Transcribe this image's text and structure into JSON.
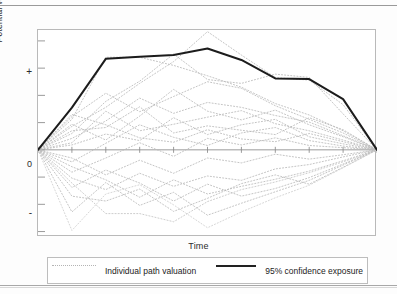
{
  "figure": {
    "axes": {
      "ylabel": "Potential value",
      "xlabel": "Time",
      "ytick_plus": "+",
      "ytick_zero": "0",
      "ytick_minus": "-"
    },
    "legend": {
      "individual_label": "Individual path valuation",
      "confidence_label": "95% confidence exposure",
      "individual_swatch": "dotted-line-swatch",
      "confidence_swatch": "solid-line-swatch"
    }
  },
  "chart_data": {
    "type": "line",
    "title": "",
    "subtitle": "",
    "xlabel": "Time",
    "ylabel": "Potential value",
    "xlim": [
      0,
      20
    ],
    "ylim": [
      -3.2,
      4.4
    ],
    "grid": false,
    "legend_position": "bottom",
    "xticks": [
      0,
      2,
      4,
      6,
      8,
      10,
      12,
      14,
      16,
      18,
      20
    ],
    "xticklabels": [
      "",
      "",
      "",
      "",
      "",
      "",
      "",
      "",
      "",
      "",
      ""
    ],
    "yticks": [
      -3,
      -2,
      -1,
      0,
      1,
      2,
      3,
      4
    ],
    "yticklabels": [
      "",
      "-",
      "",
      "0",
      "",
      "",
      "+",
      ""
    ],
    "x": [
      0,
      2,
      4,
      6,
      8,
      10,
      12,
      14,
      16,
      18,
      20
    ],
    "series": [
      {
        "name": "95% confidence exposure",
        "style": "solid",
        "color": "#1c1c1c",
        "width": 2.0,
        "values": [
          0.0,
          1.55,
          3.34,
          3.42,
          3.48,
          3.72,
          3.3,
          2.62,
          2.6,
          1.86,
          0.0
        ]
      },
      {
        "name": "Individual path valuation 1",
        "style": "dotted",
        "color": "#b9b9b9",
        "values": [
          0.0,
          1.12,
          3.4,
          3.4,
          3.1,
          2.72,
          2.3,
          1.7,
          1.28,
          0.7,
          0.0
        ]
      },
      {
        "name": "Individual path valuation 2",
        "style": "dotted",
        "color": "#b9b9b9",
        "values": [
          0.0,
          0.86,
          1.56,
          2.44,
          3.24,
          4.34,
          3.48,
          2.66,
          2.56,
          1.66,
          0.0
        ]
      },
      {
        "name": "Individual path valuation 3",
        "style": "dotted",
        "color": "#b9b9b9",
        "values": [
          0.0,
          0.6,
          1.78,
          2.52,
          3.52,
          2.58,
          2.44,
          2.78,
          2.66,
          1.32,
          0.0
        ]
      },
      {
        "name": "Individual path valuation 4",
        "style": "dotted",
        "color": "#b9b9b9",
        "values": [
          0.0,
          1.22,
          2.08,
          1.4,
          1.96,
          2.5,
          2.26,
          1.62,
          1.12,
          0.62,
          0.0
        ]
      },
      {
        "name": "Individual path valuation 5",
        "style": "dotted",
        "color": "#b9b9b9",
        "values": [
          0.0,
          0.42,
          1.06,
          1.9,
          1.34,
          1.74,
          1.56,
          1.26,
          1.02,
          0.52,
          0.0
        ]
      },
      {
        "name": "Individual path valuation 6",
        "style": "dotted",
        "color": "#b9b9b9",
        "values": [
          0.0,
          0.94,
          0.36,
          1.24,
          2.22,
          1.42,
          1.1,
          1.46,
          0.92,
          0.48,
          0.0
        ]
      },
      {
        "name": "Individual path valuation 7",
        "style": "dotted",
        "color": "#b9b9b9",
        "values": [
          0.0,
          0.26,
          1.42,
          0.7,
          0.94,
          1.2,
          1.44,
          0.96,
          0.7,
          0.36,
          0.0
        ]
      },
      {
        "name": "Individual path valuation 8",
        "style": "dotted",
        "color": "#b9b9b9",
        "values": [
          0.0,
          0.7,
          0.82,
          1.58,
          0.62,
          0.88,
          0.72,
          0.56,
          1.18,
          0.74,
          0.0
        ]
      },
      {
        "name": "Individual path valuation 9",
        "style": "dotted",
        "color": "#b9b9b9",
        "values": [
          0.0,
          0.18,
          0.58,
          0.34,
          1.18,
          0.56,
          0.92,
          1.12,
          0.48,
          0.22,
          0.0
        ]
      },
      {
        "name": "Individual path valuation 10",
        "style": "dotted",
        "color": "#b9b9b9",
        "values": [
          0.0,
          1.3,
          0.92,
          0.44,
          0.28,
          0.74,
          0.4,
          0.3,
          0.6,
          0.3,
          0.0
        ]
      },
      {
        "name": "Individual path valuation 11",
        "style": "dotted",
        "color": "#b9b9b9",
        "values": [
          0.0,
          -0.44,
          0.24,
          0.92,
          0.46,
          0.16,
          0.62,
          0.82,
          0.34,
          0.14,
          0.0
        ]
      },
      {
        "name": "Individual path valuation 12",
        "style": "dotted",
        "color": "#b9b9b9",
        "values": [
          0.0,
          -0.82,
          -0.3,
          0.26,
          -0.24,
          0.42,
          0.18,
          0.44,
          0.16,
          0.08,
          0.0
        ]
      },
      {
        "name": "Individual path valuation 13",
        "style": "dotted",
        "color": "#b9b9b9",
        "values": [
          0.0,
          -0.3,
          -0.92,
          -0.38,
          -0.86,
          -0.3,
          -0.48,
          -0.16,
          -0.34,
          -0.18,
          0.0
        ]
      },
      {
        "name": "Individual path valuation 14",
        "style": "dotted",
        "color": "#b9b9b9",
        "values": [
          0.0,
          -1.04,
          -1.46,
          -0.86,
          -1.34,
          -0.96,
          -1.12,
          -0.7,
          -0.54,
          -0.26,
          0.0
        ]
      },
      {
        "name": "Individual path valuation 15",
        "style": "dotted",
        "color": "#b9b9b9",
        "values": [
          0.0,
          -0.62,
          -1.1,
          -1.74,
          -1.1,
          -1.62,
          -1.34,
          -1.08,
          -0.78,
          -0.4,
          0.0
        ]
      },
      {
        "name": "Individual path valuation 16",
        "style": "dotted",
        "color": "#b9b9b9",
        "values": [
          0.0,
          -1.38,
          -0.74,
          -1.22,
          -1.88,
          -1.26,
          -1.7,
          -1.42,
          -1.02,
          -0.52,
          0.0
        ]
      },
      {
        "name": "Individual path valuation 17",
        "style": "dotted",
        "color": "#b9b9b9",
        "values": [
          0.0,
          -1.7,
          -1.88,
          -1.44,
          -2.26,
          -1.78,
          -1.24,
          -0.92,
          -1.26,
          -0.64,
          0.0
        ]
      },
      {
        "name": "Individual path valuation 18",
        "style": "dotted",
        "color": "#b9b9b9",
        "values": [
          0.0,
          -2.28,
          -1.2,
          -2.04,
          -1.56,
          -2.4,
          -1.96,
          -1.54,
          -1.12,
          -0.56,
          0.0
        ]
      },
      {
        "name": "Individual path valuation 19",
        "style": "dotted",
        "color": "#cfcfcf",
        "values": [
          0.0,
          -2.96,
          -1.62,
          -1.28,
          -2.02,
          -2.86,
          -2.28,
          -1.76,
          -1.3,
          -0.66,
          0.0
        ]
      },
      {
        "name": "Individual path valuation 20",
        "style": "dotted",
        "color": "#c4c4c4",
        "values": [
          0.0,
          -1.22,
          -2.34,
          -2.34,
          -2.64,
          -1.9,
          -1.46,
          -1.18,
          -0.84,
          -0.44,
          0.0
        ]
      }
    ]
  }
}
